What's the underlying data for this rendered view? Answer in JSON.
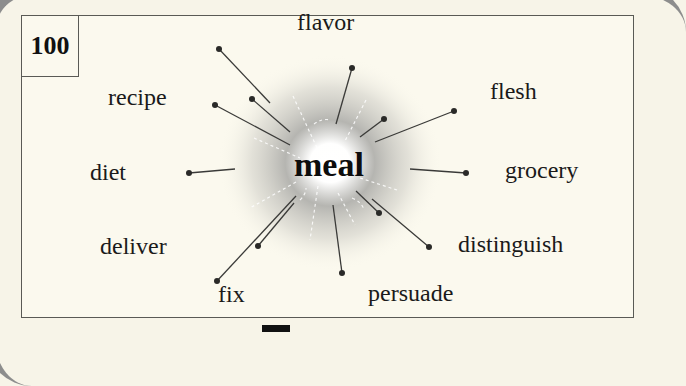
{
  "card": {
    "number": "100",
    "center_word": "meal"
  },
  "labels": [
    {
      "text": "flavor",
      "x": 297,
      "y": 10
    },
    {
      "text": "recipe",
      "x": 108,
      "y": 85
    },
    {
      "text": "flesh",
      "x": 490,
      "y": 79
    },
    {
      "text": "diet",
      "x": 90,
      "y": 160
    },
    {
      "text": "grocery",
      "x": 505,
      "y": 158
    },
    {
      "text": "deliver",
      "x": 100,
      "y": 234
    },
    {
      "text": "distinguish",
      "x": 458,
      "y": 232
    },
    {
      "text": "fix",
      "x": 218,
      "y": 282
    },
    {
      "text": "persuade",
      "x": 368,
      "y": 281
    }
  ],
  "rays": [
    {
      "dot": [
        219,
        49
      ],
      "end": [
        270,
        103
      ]
    },
    {
      "dot": [
        252,
        99
      ],
      "end": [
        290,
        132
      ]
    },
    {
      "dot": [
        215,
        105
      ],
      "end": [
        290,
        145
      ]
    },
    {
      "dot": [
        352,
        68
      ],
      "end": [
        336,
        124
      ]
    },
    {
      "dot": [
        384,
        119
      ],
      "end": [
        360,
        137
      ]
    },
    {
      "dot": [
        454,
        111
      ],
      "end": [
        375,
        142
      ]
    },
    {
      "dot": [
        466,
        173
      ],
      "end": [
        410,
        169
      ]
    },
    {
      "dot": [
        189,
        173
      ],
      "end": [
        235,
        169
      ]
    },
    {
      "dot": [
        258,
        246
      ],
      "end": [
        294,
        203
      ]
    },
    {
      "dot": [
        217,
        281
      ],
      "end": [
        296,
        196
      ]
    },
    {
      "dot": [
        342,
        273
      ],
      "end": [
        333,
        205
      ]
    },
    {
      "dot": [
        379,
        213
      ],
      "end": [
        356,
        191
      ]
    },
    {
      "dot": [
        429,
        247
      ],
      "end": [
        372,
        199
      ]
    }
  ],
  "colors": {
    "paper": "#f7f4e8",
    "ink": "#1a1a1a",
    "glow": "#8a8a8a"
  }
}
